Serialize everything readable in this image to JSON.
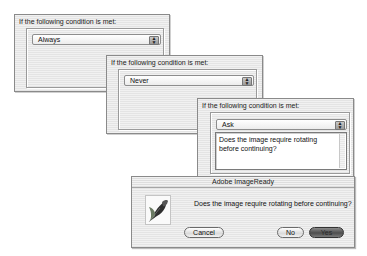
{
  "panels": [
    {
      "label": "If the following condition is met:",
      "select_value": "Always"
    },
    {
      "label": "If the following condition is met:",
      "select_value": "Never"
    },
    {
      "label": "If the following condition is met:",
      "select_value": "Ask",
      "message_text": "Does the image require rotating before continuing?"
    }
  ],
  "dialog": {
    "title": "Adobe ImageReady",
    "icon": "imageready-feather-icon",
    "message": "Does the image require rotating before continuing?",
    "buttons": {
      "cancel": "Cancel",
      "no": "No",
      "yes": "Yes"
    }
  },
  "icons": {
    "select_arrow": "updown-arrows-icon"
  }
}
